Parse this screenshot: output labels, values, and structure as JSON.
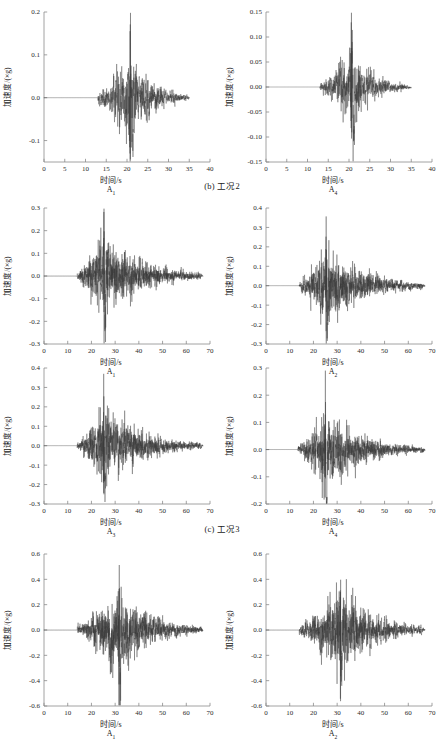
{
  "figure": {
    "background": "#ffffff",
    "trace_color": "#3a3a3a",
    "axis_color": "#8a8a8a",
    "axis_label_y": "加速度/(×g)",
    "axis_label_x": "时间/s"
  },
  "captions": [
    {
      "id": "cap-b",
      "text": "(b) 工况2"
    },
    {
      "id": "cap-c",
      "text": "(c) 工况3"
    }
  ],
  "chart_data": [
    {
      "type": "line",
      "title": "",
      "subplot_label": "A₁",
      "subplot_label_base": "A",
      "subplot_label_sub": "1",
      "group": "(b) 工况2",
      "xlabel": "时间/s",
      "ylabel": "加速度/(×g)",
      "xlim": [
        0,
        40
      ],
      "ylim": [
        -0.15,
        0.2
      ],
      "xticks": [
        0,
        5,
        10,
        15,
        20,
        25,
        30,
        35,
        40
      ],
      "xticklabels": [
        "0",
        "5",
        "10",
        "15",
        "20",
        "25",
        "30",
        "35",
        "40"
      ],
      "yticks": [
        -0.1,
        0.0,
        0.1,
        0.2
      ],
      "yticklabels": [
        "-0.1",
        "0.0",
        "0.1",
        "0.2"
      ],
      "grid": false,
      "legend": "none",
      "signal": {
        "t_start": 0,
        "t_end": 35,
        "quiet_until": 13,
        "onset": 13,
        "peak_time": 20.8,
        "peak_value": 0.178,
        "min_value": -0.128,
        "envelope_decay_end": 34,
        "seed": 11,
        "n_points": 1400,
        "carrier_hz": 4.2
      }
    },
    {
      "type": "line",
      "title": "",
      "subplot_label": "A₄",
      "subplot_label_base": "A",
      "subplot_label_sub": "4",
      "group": "(b) 工况2",
      "xlabel": "时间/s",
      "ylabel": "加速度/(×g)",
      "xlim": [
        0,
        40
      ],
      "ylim": [
        -0.15,
        0.15
      ],
      "xticks": [
        0,
        5,
        10,
        15,
        20,
        25,
        30,
        35,
        40
      ],
      "xticklabels": [
        "0",
        "5",
        "10",
        "15",
        "20",
        "25",
        "30",
        "35",
        "40"
      ],
      "yticks": [
        -0.15,
        -0.1,
        -0.05,
        0.0,
        0.05,
        0.1,
        0.15
      ],
      "yticklabels": [
        "-0.15",
        "-0.10",
        "-0.05",
        "0.00",
        "0.05",
        "0.10",
        "0.15"
      ],
      "grid": false,
      "legend": "none",
      "signal": {
        "t_start": 0,
        "t_end": 35,
        "quiet_until": 13,
        "onset": 13,
        "peak_time": 20.6,
        "peak_value": 0.118,
        "min_value": -0.122,
        "envelope_decay_end": 34,
        "seed": 23,
        "n_points": 1400,
        "carrier_hz": 4.6
      }
    },
    {
      "type": "line",
      "title": "",
      "subplot_label": "A₁",
      "subplot_label_base": "A",
      "subplot_label_sub": "1",
      "group": "(c) 工况3",
      "xlabel": "时间/s",
      "ylabel": "加速度/(×g)",
      "xlim": [
        0,
        70
      ],
      "ylim": [
        -0.3,
        0.3
      ],
      "xticks": [
        0,
        10,
        20,
        30,
        40,
        50,
        60,
        70
      ],
      "xticklabels": [
        "0",
        "10",
        "20",
        "30",
        "40",
        "50",
        "60",
        "70"
      ],
      "yticks": [
        -0.3,
        -0.2,
        -0.1,
        0.0,
        0.1,
        0.2,
        0.3
      ],
      "yticklabels": [
        "-0.3",
        "-0.2",
        "-0.1",
        "0.0",
        "0.1",
        "0.2",
        "0.3"
      ],
      "grid": false,
      "legend": "none",
      "signal": {
        "t_start": 0,
        "t_end": 67,
        "quiet_until": 14,
        "onset": 14,
        "peak_time": 25.3,
        "peak_value": 0.3,
        "min_value": -0.235,
        "envelope_decay_end": 66,
        "seed": 31,
        "n_points": 2000,
        "carrier_hz": 3.6
      }
    },
    {
      "type": "line",
      "title": "",
      "subplot_label": "A₂",
      "subplot_label_base": "A",
      "subplot_label_sub": "2",
      "group": "(c) 工况3",
      "xlabel": "时间/s",
      "ylabel": "加速度/(×g)",
      "xlim": [
        0,
        70
      ],
      "ylim": [
        -0.3,
        0.4
      ],
      "xticks": [
        0,
        10,
        20,
        30,
        40,
        50,
        60,
        70
      ],
      "xticklabels": [
        "0",
        "10",
        "20",
        "30",
        "40",
        "50",
        "60",
        "70"
      ],
      "yticks": [
        -0.3,
        -0.2,
        -0.1,
        0.0,
        0.1,
        0.2,
        0.3,
        0.4
      ],
      "yticklabels": [
        "-0.3",
        "-0.2",
        "-0.1",
        "0.0",
        "0.1",
        "0.2",
        "0.3",
        "0.4"
      ],
      "grid": false,
      "legend": "none",
      "signal": {
        "t_start": 0,
        "t_end": 67,
        "quiet_until": 14,
        "onset": 14,
        "peak_time": 25.4,
        "peak_value": 0.32,
        "min_value": -0.265,
        "envelope_decay_end": 66,
        "seed": 47,
        "n_points": 2000,
        "carrier_hz": 3.8
      }
    },
    {
      "type": "line",
      "title": "",
      "subplot_label": "A₃",
      "subplot_label_base": "A",
      "subplot_label_sub": "3",
      "group": "(c) 工况3",
      "xlabel": "时间/s",
      "ylabel": "加速度/(×g)",
      "xlim": [
        0,
        70
      ],
      "ylim": [
        -0.3,
        0.4
      ],
      "xticks": [
        0,
        10,
        20,
        30,
        40,
        50,
        60,
        70
      ],
      "xticklabels": [
        "0",
        "10",
        "20",
        "30",
        "40",
        "50",
        "60",
        "70"
      ],
      "yticks": [
        -0.3,
        -0.2,
        -0.1,
        0.0,
        0.1,
        0.2,
        0.3,
        0.4
      ],
      "yticklabels": [
        "-0.3",
        "-0.2",
        "-0.1",
        "0.0",
        "0.1",
        "0.2",
        "0.3",
        "0.4"
      ],
      "grid": false,
      "legend": "none",
      "signal": {
        "t_start": 0,
        "t_end": 67,
        "quiet_until": 14,
        "onset": 14,
        "peak_time": 25.2,
        "peak_value": 0.33,
        "min_value": -0.262,
        "envelope_decay_end": 66,
        "seed": 59,
        "n_points": 2000,
        "carrier_hz": 3.7
      }
    },
    {
      "type": "line",
      "title": "",
      "subplot_label": "A₄",
      "subplot_label_base": "A",
      "subplot_label_sub": "4",
      "group": "(c) 工况3",
      "xlabel": "时间/s",
      "ylabel": "加速度/(×g)",
      "xlim": [
        0,
        70
      ],
      "ylim": [
        -0.2,
        0.3
      ],
      "xticks": [
        0,
        10,
        20,
        30,
        40,
        50,
        60,
        70
      ],
      "xticklabels": [
        "0",
        "10",
        "20",
        "30",
        "40",
        "50",
        "60",
        "70"
      ],
      "yticks": [
        -0.2,
        -0.1,
        0.0,
        0.1,
        0.2,
        0.3
      ],
      "yticklabels": [
        "-0.2",
        "-0.1",
        "0.0",
        "0.1",
        "0.2",
        "0.3"
      ],
      "grid": false,
      "legend": "none",
      "signal": {
        "t_start": 0,
        "t_end": 67,
        "quiet_until": 13.5,
        "onset": 13.5,
        "peak_time": 25.0,
        "peak_value": 0.205,
        "min_value": -0.228,
        "envelope_decay_end": 66,
        "seed": 71,
        "n_points": 2000,
        "carrier_hz": 4.0
      }
    },
    {
      "type": "line",
      "title": "",
      "subplot_label": "A₁",
      "subplot_label_base": "A",
      "subplot_label_sub": "1",
      "group": "(d)",
      "xlabel": "时间/s",
      "ylabel": "加速度/(×g)",
      "xlim": [
        0,
        70
      ],
      "ylim": [
        -0.6,
        0.6
      ],
      "xticks": [
        0,
        10,
        20,
        30,
        40,
        50,
        60,
        70
      ],
      "xticklabels": [
        "0",
        "10",
        "20",
        "30",
        "40",
        "50",
        "60",
        "70"
      ],
      "yticks": [
        -0.6,
        -0.4,
        -0.2,
        0.0,
        0.2,
        0.4,
        0.6
      ],
      "yticklabels": [
        "-0.6",
        "-0.4",
        "-0.2",
        "0.0",
        "0.2",
        "0.4",
        "0.6"
      ],
      "grid": false,
      "legend": "none",
      "signal": {
        "t_start": 0,
        "t_end": 67,
        "quiet_until": 14,
        "onset": 14,
        "peak_time": 31.6,
        "peak_value": 0.45,
        "min_value": -0.55,
        "envelope_decay_end": 66,
        "seed": 83,
        "n_points": 2000,
        "carrier_hz": 3.9
      }
    },
    {
      "type": "line",
      "title": "",
      "subplot_label": "A₂",
      "subplot_label_base": "A",
      "subplot_label_sub": "2",
      "group": "(d)",
      "xlabel": "时间/s",
      "ylabel": "加速度/(×g)",
      "xlim": [
        0,
        70
      ],
      "ylim": [
        -0.6,
        0.6
      ],
      "xticks": [
        0,
        10,
        20,
        30,
        40,
        50,
        60,
        70
      ],
      "xticklabels": [
        "0",
        "10",
        "20",
        "30",
        "40",
        "50",
        "60",
        "70"
      ],
      "yticks": [
        -0.6,
        -0.4,
        -0.2,
        0.0,
        0.2,
        0.4,
        0.6
      ],
      "yticklabels": [
        "-0.6",
        "-0.4",
        "-0.2",
        "0.0",
        "0.2",
        "0.4",
        "0.6"
      ],
      "grid": false,
      "legend": "none",
      "signal": {
        "t_start": 0,
        "t_end": 67,
        "quiet_until": 14,
        "onset": 14,
        "peak_time": 31.4,
        "peak_value": 0.56,
        "min_value": -0.43,
        "envelope_decay_end": 66,
        "seed": 97,
        "n_points": 2000,
        "carrier_hz": 4.1
      }
    }
  ],
  "layout": {
    "panel_positions": [
      {
        "left": 0,
        "top": 0
      },
      {
        "left": 222,
        "top": 0
      },
      {
        "left": 0,
        "top": 196
      },
      {
        "left": 222,
        "top": 196
      },
      {
        "left": 0,
        "top": 356
      },
      {
        "left": 222,
        "top": 356
      },
      {
        "left": 0,
        "top": 542
      },
      {
        "left": 222,
        "top": 542
      }
    ],
    "caption_tops": [
      178,
      521
    ]
  }
}
